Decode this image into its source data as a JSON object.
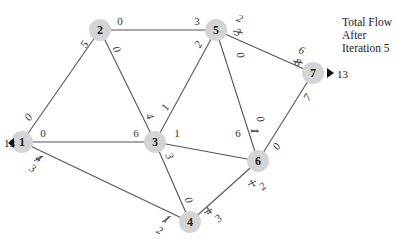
{
  "caption": {
    "line1": "Total Flow",
    "line2": "After",
    "line3": "Iteration 5"
  },
  "source": {
    "node": "1",
    "flow_in": "13"
  },
  "sink": {
    "node": "7",
    "flow_out": "13"
  },
  "nodes": [
    {
      "id": "1",
      "x": 22,
      "y": 142
    },
    {
      "id": "2",
      "x": 100,
      "y": 30
    },
    {
      "id": "3",
      "x": 155,
      "y": 142
    },
    {
      "id": "4",
      "x": 190,
      "y": 222
    },
    {
      "id": "5",
      "x": 216,
      "y": 30
    },
    {
      "id": "6",
      "x": 258,
      "y": 161
    },
    {
      "id": "7",
      "x": 313,
      "y": 73
    }
  ],
  "edges": [
    {
      "from": "1",
      "to": "2",
      "label_near_from": "0",
      "label_near_to": "5"
    },
    {
      "from": "1",
      "to": "3",
      "label_near_from": "0",
      "label_near_to": "6"
    },
    {
      "from": "1",
      "to": "4",
      "label_near_from": "3",
      "label_near_from_struck": "4",
      "label_near_to": "2",
      "label_near_to_struck": "1"
    },
    {
      "from": "2",
      "to": "5",
      "label_near_from": "0",
      "label_near_to": "3"
    },
    {
      "from": "2",
      "to": "3",
      "label_near_from": "0",
      "label_near_to": "4"
    },
    {
      "from": "3",
      "to": "5",
      "label_near_from": "1",
      "label_near_to": "2"
    },
    {
      "from": "3",
      "to": "6",
      "label_near_from": "1",
      "label_near_to": "6"
    },
    {
      "from": "3",
      "to": "4",
      "label_near_from": "3",
      "label_near_to": "0"
    },
    {
      "from": "5",
      "to": "7",
      "label_near_from": "2",
      "label_near_from_struck": "3",
      "label_near_to": "6",
      "label_near_to_struck": "8"
    },
    {
      "from": "5",
      "to": "6",
      "label_near_from": "0",
      "label_near_to": "0",
      "label_near_to_struck": "1"
    },
    {
      "from": "6",
      "to": "7",
      "label_near_from": "0",
      "label_near_to": "7"
    },
    {
      "from": "6",
      "to": "4",
      "label_near_from": "2",
      "label_near_from_struck": "1",
      "label_near_to": "3",
      "label_near_to_struck": "4"
    }
  ],
  "labels": {
    "n1": "1",
    "n2": "2",
    "n3": "3",
    "n4": "4",
    "n5": "5",
    "n6": "6",
    "n7": "7",
    "e12a": "0",
    "e12b": "5",
    "e13a": "0",
    "e13b": "6",
    "e14a_old": "4",
    "e14a": "3",
    "e14b_old": "1",
    "e14b": "2",
    "e25a": "0",
    "e25b": "3",
    "e23a": "0",
    "e23b": "4",
    "e35a": "1",
    "e35b": "2",
    "e36a": "1",
    "e36b": "6",
    "e34a": "3",
    "e34b": "0",
    "e57a_old": "3",
    "e57a": "2",
    "e57b_old": "8",
    "e57b": "6",
    "e56a": "0",
    "e56b_old": "1",
    "e56b": "0",
    "e67a": "0",
    "e67b": "7",
    "e64a_old": "1",
    "e64a": "2",
    "e64b_old": "4",
    "e64b": "3",
    "in_flow": "13",
    "out_flow": "13"
  }
}
